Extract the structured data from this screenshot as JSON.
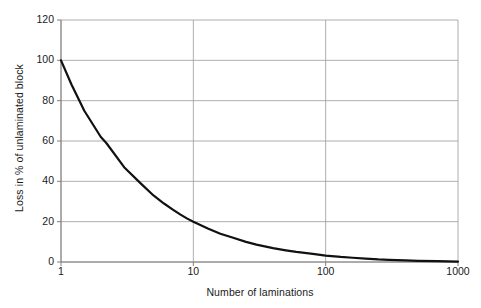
{
  "chart_data": {
    "type": "line",
    "title": "",
    "xlabel": "Number of laminations",
    "ylabel": "Loss in % of unlaminated block",
    "xscale": "log",
    "yscale": "linear",
    "xlim": [
      1,
      1000
    ],
    "ylim": [
      0,
      120
    ],
    "grid": true,
    "legend": "none",
    "x_ticks": [
      "1",
      "10",
      "100",
      "1000"
    ],
    "x_tick_values": [
      1,
      10,
      100,
      1000
    ],
    "y_ticks": [
      "0",
      "20",
      "40",
      "60",
      "80",
      "100",
      "120"
    ],
    "y_tick_values": [
      0,
      20,
      40,
      60,
      80,
      100,
      120
    ],
    "series": [
      {
        "name": "Loss",
        "color": "#111111",
        "x": [
          1,
          1.2,
          1.5,
          2,
          2.2,
          3,
          4,
          5,
          6,
          7,
          8,
          9,
          10,
          13,
          16,
          20,
          25,
          30,
          40,
          50,
          60,
          80,
          100,
          130,
          160,
          200,
          250,
          300,
          400,
          500,
          700,
          1000
        ],
        "y": [
          100,
          88,
          75,
          62,
          59,
          47,
          39,
          33,
          29,
          26,
          23.5,
          21.5,
          20,
          16.5,
          14,
          12,
          10,
          8.6,
          6.9,
          5.8,
          5.0,
          4.0,
          3.2,
          2.5,
          2.1,
          1.7,
          1.3,
          1.1,
          0.8,
          0.6,
          0.4,
          0.2
        ]
      }
    ]
  },
  "style": {
    "grid_color": "#9a9a9a",
    "axis_color": "#808080",
    "text_color": "#1a1a1a",
    "background": "#ffffff"
  }
}
